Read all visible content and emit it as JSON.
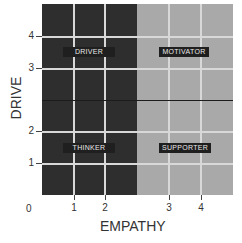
{
  "chart": {
    "xlabel": "EMPATHY",
    "ylabel": "DRIVE",
    "origin_label": "0",
    "x_ticks": [
      "1",
      "2",
      "3",
      "4"
    ],
    "y_ticks": [
      "4",
      "3",
      "2",
      "1"
    ],
    "quadrants": [
      {
        "label": "DRIVER",
        "position": "top-left",
        "color": "#2e2e2e"
      },
      {
        "label": "MOTIVATOR",
        "position": "top-right",
        "color": "#a9a9a9"
      },
      {
        "label": "THINKER",
        "position": "bottom-left",
        "color": "#2e2e2e"
      },
      {
        "label": "SUPPORTER",
        "position": "bottom-right",
        "color": "#a9a9a9"
      }
    ]
  }
}
